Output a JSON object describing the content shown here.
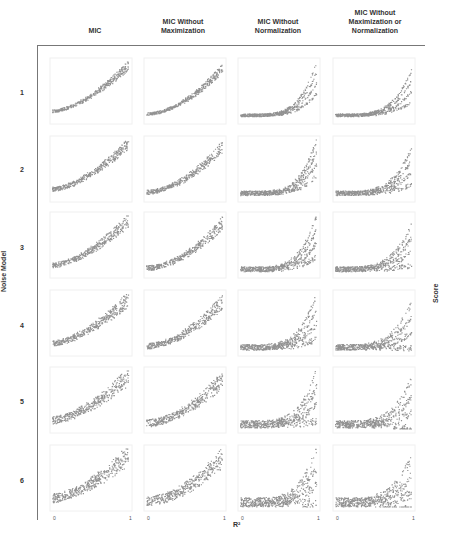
{
  "chart_data": {
    "type": "scatter",
    "title": "",
    "layout": "grid 6 rows x 4 columns of small-multiple scatter panels",
    "columns": [
      "MIC",
      "MIC Without Maximization",
      "MIC Without Normalization",
      "MIC Without Maximization or Normalization"
    ],
    "rows": [
      "1",
      "2",
      "3",
      "4",
      "5",
      "6"
    ],
    "row_axis_label": "Noise Model",
    "xlabel": "R²",
    "ylabel": "Score",
    "x_ticks": [
      "0",
      "1"
    ],
    "xlim": [
      0,
      1
    ],
    "grid": false,
    "legend": null,
    "panel_shape": {
      "MIC": {
        "curvature": 1.6,
        "start": 0.15,
        "end": 1.0
      },
      "MIC Without Maximization": {
        "curvature": 1.8,
        "start": 0.1,
        "end": 0.95
      },
      "MIC Without Normalization": {
        "curvature": 4.5,
        "start": 0.08,
        "end": 1.0
      },
      "MIC Without Maximization or Normalization": {
        "curvature": 4.0,
        "start": 0.08,
        "end": 0.85
      }
    },
    "row_spread": [
      0.05,
      0.08,
      0.09,
      0.1,
      0.13,
      0.16
    ]
  },
  "labels": {
    "col_heads": [
      "MIC",
      "MIC Without\nMaximization",
      "MIC Without\nNormalization",
      "MIC Without\nMaximization or\nNormalization"
    ],
    "rows": [
      "1",
      "2",
      "3",
      "4",
      "5",
      "6"
    ],
    "noise_model": "Noise Model",
    "score": "Score",
    "r2": "R²",
    "tick0": "0",
    "tick1": "1"
  },
  "colors": {
    "points": "#6e6e6e",
    "frame": "#777777"
  }
}
